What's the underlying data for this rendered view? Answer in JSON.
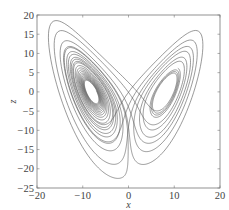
{
  "chart_data": {
    "type": "line",
    "title": "",
    "xlabel": "x",
    "ylabel": "z",
    "xlim": [
      -20,
      20
    ],
    "ylim": [
      -25,
      20
    ],
    "xticks": [
      -20,
      -10,
      0,
      10,
      20
    ],
    "yticks": [
      -25,
      -20,
      -15,
      -10,
      -5,
      0,
      5,
      10,
      15,
      20
    ],
    "xtick_labels": [
      "-20",
      "-10",
      "0",
      "10",
      "20"
    ],
    "ytick_labels": [
      "-25",
      "-20",
      "-15",
      "-10",
      "-5",
      "0",
      "5",
      "5",
      "10",
      "15",
      "20"
    ],
    "grid": false,
    "legend": null,
    "series": [
      {
        "name": "trajectory",
        "color": "#555555",
        "generator": {
          "system": "lorenz",
          "sigma": 10,
          "rho": 28,
          "beta": 2.6667,
          "initial": [
            1,
            1,
            1
          ],
          "dt": 0.005,
          "steps": 5200,
          "skip": 600,
          "x_scale": 0.95,
          "z_offset": -27,
          "z_scale": 1.0
        },
        "approx_extent": {
          "x": [
            -19,
            17
          ],
          "z": [
            -22,
            16
          ]
        }
      }
    ]
  },
  "axes": {
    "plot_box": {
      "left": 37,
      "top": 15,
      "right": 220,
      "bottom": 188
    },
    "frame_color": "#777777",
    "text_color": "#444444"
  }
}
